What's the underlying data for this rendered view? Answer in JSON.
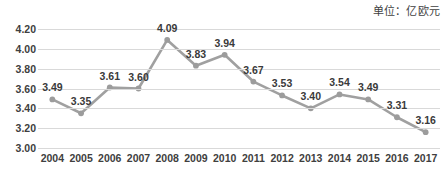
{
  "unit_caption": "单位：亿欧元",
  "colors": {
    "line": "#a0a0a0",
    "marker": "#9c9c9c",
    "grid": "#d9d9d9",
    "text": "#404040",
    "background": "#ffffff"
  },
  "chart_data": {
    "type": "line",
    "title": "",
    "subtitle": "",
    "xlabel": "",
    "ylabel": "",
    "unit": "亿欧元",
    "categories": [
      "2004",
      "2005",
      "2006",
      "2007",
      "2008",
      "2009",
      "2010",
      "2011",
      "2012",
      "2013",
      "2014",
      "2015",
      "2016",
      "2017"
    ],
    "values": [
      3.49,
      3.35,
      3.61,
      3.6,
      4.09,
      3.83,
      3.94,
      3.67,
      3.53,
      3.4,
      3.54,
      3.49,
      3.31,
      3.16
    ],
    "data_labels": [
      "3.49",
      "3.35",
      "3.61",
      "3.60",
      "4.09",
      "3.83",
      "3.94",
      "3.67",
      "3.53",
      "3.40",
      "3.54",
      "3.49",
      "3.31",
      "3.16"
    ],
    "label_positions": [
      "above",
      "above",
      "above",
      "above",
      "above",
      "above",
      "above",
      "above",
      "above",
      "above",
      "above",
      "above",
      "above",
      "above"
    ],
    "ylim": [
      3.0,
      4.2
    ],
    "yticks": [
      3.0,
      3.2,
      3.4,
      3.6,
      3.8,
      4.0,
      4.2
    ],
    "ytick_labels": [
      "3.00",
      "3.20",
      "3.40",
      "3.60",
      "3.80",
      "4.00",
      "4.20"
    ],
    "grid": true,
    "grid_axis": "y",
    "legend": false,
    "legend_position": "none",
    "markers": true,
    "series": [
      {
        "name": "",
        "values": [
          3.49,
          3.35,
          3.61,
          3.6,
          4.09,
          3.83,
          3.94,
          3.67,
          3.53,
          3.4,
          3.54,
          3.49,
          3.31,
          3.16
        ]
      }
    ]
  }
}
